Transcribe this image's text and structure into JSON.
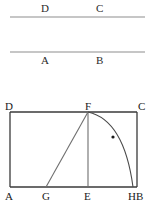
{
  "figure": {
    "title_text": "",
    "canvas": {
      "width": 156,
      "height": 212,
      "background": "#ffffff"
    },
    "stroke_colors": {
      "top_rules": "#8d8d8d",
      "rectangle": "#3a3a3a",
      "inner_lines": "#6e6e6e",
      "arc": "#4a4a4a",
      "marker_dot": "#1a1a1a"
    },
    "top_section": {
      "rule_upper": {
        "x1": 10,
        "y1": 17,
        "x2": 145,
        "y2": 17
      },
      "rule_lower": {
        "x1": 10,
        "y1": 52,
        "x2": 145,
        "y2": 52
      },
      "labels": [
        {
          "name": "label-D-top",
          "text": "D",
          "x": 41,
          "y": 3
        },
        {
          "name": "label-C-top",
          "text": "C",
          "x": 96,
          "y": 3
        },
        {
          "name": "label-A-top",
          "text": "A",
          "x": 41,
          "y": 55
        },
        {
          "name": "label-B-top",
          "text": "B",
          "x": 96,
          "y": 55
        }
      ]
    },
    "rectangle_section": {
      "rect": {
        "left": 10,
        "top": 112,
        "right": 137,
        "bottom": 187
      },
      "points": {
        "A": {
          "x": 10,
          "y": 187
        },
        "B": {
          "x": 137,
          "y": 187
        },
        "C": {
          "x": 137,
          "y": 112
        },
        "D": {
          "x": 10,
          "y": 112
        },
        "E": {
          "x": 88,
          "y": 187
        },
        "F": {
          "x": 88,
          "y": 112
        },
        "G": {
          "x": 46,
          "y": 187
        },
        "H": {
          "x": 133,
          "y": 187
        }
      },
      "segments": [
        {
          "name": "segment-GF",
          "from": "G",
          "to": "F"
        },
        {
          "name": "segment-EF",
          "from": "E",
          "to": "F"
        }
      ],
      "arc": {
        "name": "arc-F-to-H",
        "from": "F",
        "to": "H",
        "control": {
          "x": 124,
          "y": 120
        },
        "marker_dot": {
          "x": 113,
          "y": 137,
          "r": 1.6
        }
      },
      "labels": [
        {
          "name": "vertex-label-D",
          "text": "D",
          "x": 5,
          "y": 101
        },
        {
          "name": "vertex-label-F",
          "text": "F",
          "x": 85,
          "y": 101
        },
        {
          "name": "vertex-label-C",
          "text": "C",
          "x": 138,
          "y": 101
        },
        {
          "name": "vertex-label-A",
          "text": "A",
          "x": 5,
          "y": 191
        },
        {
          "name": "vertex-label-G",
          "text": "G",
          "x": 42,
          "y": 191
        },
        {
          "name": "vertex-label-E",
          "text": "E",
          "x": 84,
          "y": 191
        },
        {
          "name": "vertex-label-HB",
          "text": "HB",
          "x": 128,
          "y": 191
        }
      ]
    }
  }
}
